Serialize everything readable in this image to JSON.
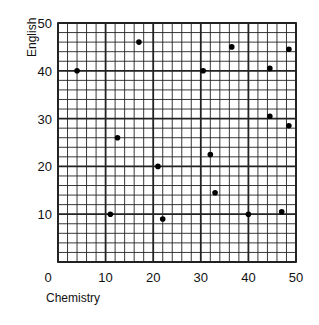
{
  "chart_data": {
    "type": "scatter",
    "title": "",
    "xlabel": "Chemistry",
    "ylabel": "English",
    "xlim": [
      0,
      50
    ],
    "ylim": [
      0,
      50
    ],
    "x_ticks": [
      0,
      10,
      20,
      30,
      40,
      50
    ],
    "y_ticks": [
      10,
      20,
      30,
      40,
      50
    ],
    "grid": {
      "minor_step": 2,
      "major_step": 10,
      "on": true
    },
    "legend": null,
    "points": [
      {
        "x": 4,
        "y": 40
      },
      {
        "x": 12.5,
        "y": 26
      },
      {
        "x": 11,
        "y": 10
      },
      {
        "x": 17,
        "y": 46
      },
      {
        "x": 21,
        "y": 20
      },
      {
        "x": 22,
        "y": 9
      },
      {
        "x": 30.5,
        "y": 40
      },
      {
        "x": 32,
        "y": 22.5
      },
      {
        "x": 33,
        "y": 14.5
      },
      {
        "x": 36.5,
        "y": 45
      },
      {
        "x": 40,
        "y": 10
      },
      {
        "x": 44.5,
        "y": 40.5
      },
      {
        "x": 44.5,
        "y": 30.5
      },
      {
        "x": 47,
        "y": 10.5
      },
      {
        "x": 48.5,
        "y": 44.5
      },
      {
        "x": 48.5,
        "y": 28.5
      }
    ]
  },
  "style": {
    "point_color": "#000000",
    "grid_color": "#222222",
    "background": "#ffffff"
  }
}
